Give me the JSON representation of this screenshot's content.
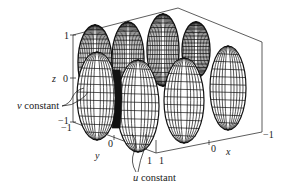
{
  "figure": {
    "type": "3d-parametric-surface-wireframe",
    "colors": {
      "line": "#111111",
      "background": "#ffffff",
      "axis": "#333333"
    }
  },
  "axes": {
    "z": {
      "label": "z",
      "ticks": [
        "1",
        "0",
        "−1"
      ]
    },
    "y": {
      "label": "y",
      "ticks": [
        "−1",
        "0",
        "1"
      ]
    },
    "x": {
      "label": "x",
      "ticks": [
        "1",
        "0",
        "−1"
      ]
    }
  },
  "annotations": {
    "v_constant": {
      "prefix": "v",
      "text": " constant"
    },
    "u_constant": {
      "prefix": "u",
      "text": " constant"
    }
  },
  "surface": {
    "lobes_front_row": 4,
    "lobes_back_row": 4,
    "z_range": [
      -1,
      1
    ],
    "x_range": [
      -1,
      1
    ],
    "y_range": [
      -1,
      1
    ]
  }
}
